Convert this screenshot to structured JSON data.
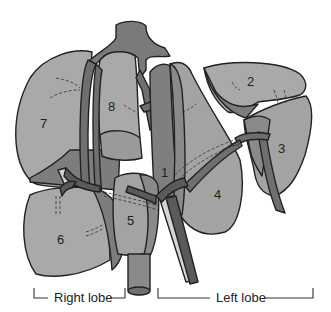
{
  "figure": {
    "colors": {
      "parenchyma_light": "#a9a9a9",
      "parenchyma_mid": "#8f8f8f",
      "parenchyma_dark": "#6f6f6f",
      "vessel_dark": "#5a5a5a",
      "vessel_light": "#d4d4d4",
      "outline": "#222222",
      "background": "#ffffff"
    },
    "segments": [
      {
        "id": "1",
        "label": "1"
      },
      {
        "id": "2",
        "label": "2"
      },
      {
        "id": "3",
        "label": "3"
      },
      {
        "id": "4",
        "label": "4"
      },
      {
        "id": "5",
        "label": "5"
      },
      {
        "id": "6",
        "label": "6"
      },
      {
        "id": "7",
        "label": "7"
      },
      {
        "id": "8",
        "label": "8"
      }
    ],
    "lobes": {
      "right": "Right lobe",
      "left": "Left lobe"
    }
  }
}
